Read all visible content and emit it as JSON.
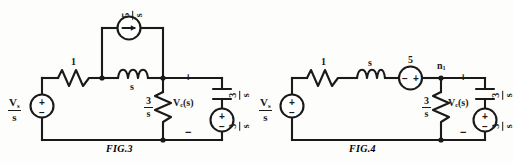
{
  "document": {
    "title": "Laplace-domain circuit diagrams: Fig.3 and Fig.4",
    "background_color": "#fdfdfb",
    "ink_color": "#1a1a1a"
  },
  "figures": [
    {
      "id": "fig3",
      "caption": "FIG.3",
      "description": "Source-transformed Laplace domain circuit with a current source branch paralleling the inductor",
      "components": [
        {
          "name": "source-vs-left",
          "type": "voltage-source",
          "label_numerator": "V",
          "label_subscript": "s",
          "label_denominator": "s",
          "plus": "+",
          "minus": "−"
        },
        {
          "name": "resistor-series",
          "type": "resistor",
          "label": "1"
        },
        {
          "name": "inductor-series",
          "type": "inductor",
          "label": "s"
        },
        {
          "name": "current-source-top",
          "type": "current-source",
          "label_numerator": "5",
          "label_denominator": "s",
          "arrow_direction": "right"
        },
        {
          "name": "resistor-shunt",
          "type": "resistor",
          "label_numerator": "3",
          "label_denominator": "s"
        },
        {
          "name": "capacitor-right",
          "type": "capacitor",
          "label_numerator": "3",
          "label_denominator": "s"
        },
        {
          "name": "source-right",
          "type": "voltage-source",
          "label_numerator": "3",
          "label_denominator": "s",
          "plus": "+",
          "minus": "−"
        }
      ],
      "annotations": [
        {
          "name": "output-voltage-label",
          "text": "V",
          "subscript": "c",
          "suffix": "(s)"
        },
        {
          "name": "output-plus",
          "text": "+"
        },
        {
          "name": "output-minus",
          "text": "−"
        }
      ]
    },
    {
      "id": "fig4",
      "caption": "FIG.4",
      "description": "Equivalent Laplace domain circuit with series voltage source replacing the current source, node n1 marked",
      "components": [
        {
          "name": "source-vs-left",
          "type": "voltage-source",
          "label_numerator": "V",
          "label_subscript": "s",
          "label_denominator": "s",
          "plus": "+",
          "minus": "−"
        },
        {
          "name": "resistor-series",
          "type": "resistor",
          "label": "1"
        },
        {
          "name": "inductor-series",
          "type": "inductor",
          "label": "s"
        },
        {
          "name": "source-series-mid",
          "type": "voltage-source",
          "label": "5",
          "left_terminal": "−",
          "right_terminal": "+"
        },
        {
          "name": "resistor-shunt",
          "type": "resistor",
          "label_numerator": "3",
          "label_denominator": "s"
        },
        {
          "name": "capacitor-right",
          "type": "capacitor",
          "label_numerator": "3",
          "label_denominator": "s"
        },
        {
          "name": "source-right",
          "type": "voltage-source",
          "label_numerator": "3",
          "label_denominator": "s",
          "plus": "+",
          "minus": "−"
        }
      ],
      "annotations": [
        {
          "name": "node-label",
          "text": "n",
          "subscript": "1"
        },
        {
          "name": "output-voltage-label",
          "text": "V",
          "subscript": "c",
          "suffix": "(s)"
        },
        {
          "name": "output-plus",
          "text": "+"
        },
        {
          "name": "output-minus",
          "text": "−"
        }
      ]
    }
  ],
  "labels": {
    "fig3": {
      "caption": "FIG.3",
      "vs_num": "V",
      "vs_sub": "s",
      "vs_den": "s",
      "src_plus": "+",
      "src_minus": "−",
      "resistor": "1",
      "inductor": "s",
      "isrc_num": "5",
      "isrc_den": "s",
      "rshunt_num": "3",
      "rshunt_den": "s",
      "cap_num": "3",
      "cap_den": "s",
      "rsrc_num": "3",
      "rsrc_den": "s",
      "rsrc_plus": "+",
      "rsrc_minus": "−",
      "vc": "V",
      "vc_sub": "c",
      "vc_suffix": "(s)",
      "out_plus": "+",
      "out_minus": "−"
    },
    "fig4": {
      "caption": "FIG.4",
      "vs_num": "V",
      "vs_sub": "s",
      "vs_den": "s",
      "src_plus": "+",
      "src_minus": "−",
      "resistor": "1",
      "inductor": "s",
      "midsrc": "5",
      "midsrc_left": "−",
      "midsrc_right": "+",
      "node": "n",
      "node_sub": "1",
      "rshunt_num": "3",
      "rshunt_den": "s",
      "cap_num": "3",
      "cap_den": "s",
      "rsrc_num": "3",
      "rsrc_den": "s",
      "rsrc_plus": "+",
      "rsrc_minus": "−",
      "vc": "V",
      "vc_sub": "c",
      "vc_suffix": "(s)",
      "out_plus": "+",
      "out_minus": "−"
    }
  }
}
